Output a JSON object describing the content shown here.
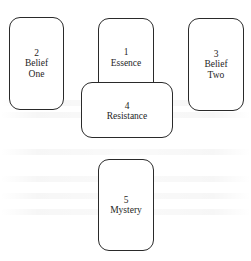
{
  "diagram": {
    "type": "card-spread-layout",
    "cards": [
      {
        "id": "card-1",
        "number": "1",
        "lines": [
          "Essence"
        ]
      },
      {
        "id": "card-2",
        "number": "2",
        "lines": [
          "Belief",
          "One"
        ]
      },
      {
        "id": "card-3",
        "number": "3",
        "lines": [
          "Belief",
          "Two"
        ]
      },
      {
        "id": "card-4",
        "number": "4",
        "lines": [
          "Resistance"
        ]
      },
      {
        "id": "card-5",
        "number": "5",
        "lines": [
          "Mystery"
        ]
      }
    ]
  },
  "colors": {
    "border": "#2a2a2a",
    "text": "#1e1e1e",
    "background": "#ffffff"
  }
}
